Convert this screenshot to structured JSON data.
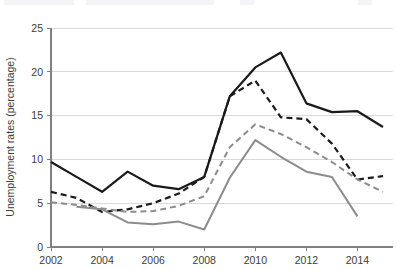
{
  "chart_data": {
    "type": "line",
    "title": "",
    "xlabel": "",
    "ylabel": "Unemployment rates (percentage)",
    "xlim": [
      2002,
      2015
    ],
    "ylim": [
      0,
      25
    ],
    "ytick_values": [
      0,
      5,
      10,
      15,
      20,
      25
    ],
    "ytick_labels": [
      "0",
      "5",
      "10",
      "15",
      "20",
      "25"
    ],
    "xtick_values": [
      2002,
      2004,
      2006,
      2008,
      2010,
      2012,
      2014
    ],
    "xtick_labels": [
      "2002",
      "2004",
      "2006",
      "2008",
      "2010",
      "2012",
      "2014"
    ],
    "grid": true,
    "legend": "none",
    "x": [
      2002,
      2003,
      2004,
      2005,
      2006,
      2007,
      2008,
      2009,
      2010,
      2011,
      2012,
      2013,
      2014,
      2015
    ],
    "series": [
      {
        "name": "series-black-solid",
        "style": "solid",
        "color": "#1a1a1a",
        "width": 2.2,
        "x": [
          2002,
          2003,
          2004,
          2005,
          2006,
          2007,
          2008,
          2009,
          2010,
          2011,
          2012,
          2013,
          2014,
          2015
        ],
        "values": [
          9.7,
          8.0,
          6.3,
          8.6,
          7.0,
          6.6,
          8.0,
          17.2,
          20.5,
          22.2,
          16.4,
          15.4,
          15.5,
          13.7
        ]
      },
      {
        "name": "series-black-dashed",
        "style": "dashed",
        "color": "#1a1a1a",
        "width": 2.2,
        "x": [
          2002,
          2003,
          2004,
          2005,
          2006,
          2007,
          2008,
          2009,
          2010,
          2011,
          2012,
          2013,
          2014,
          2015
        ],
        "values": [
          6.3,
          5.6,
          4.0,
          4.3,
          5.0,
          6.1,
          8.0,
          17.2,
          19.0,
          14.8,
          14.6,
          11.8,
          7.7,
          8.1
        ]
      },
      {
        "name": "series-gray-dashed",
        "style": "dashed",
        "color": "#8c8c8c",
        "width": 2.0,
        "x": [
          2002,
          2003,
          2004,
          2005,
          2006,
          2007,
          2008,
          2009,
          2010,
          2011,
          2012,
          2013,
          2014,
          2015
        ],
        "values": [
          5.1,
          4.8,
          4.4,
          4.0,
          4.1,
          4.7,
          5.8,
          11.4,
          14.0,
          12.9,
          11.4,
          9.7,
          7.7,
          6.3
        ]
      },
      {
        "name": "series-gray-solid",
        "style": "solid",
        "color": "#8c8c8c",
        "width": 2.0,
        "x": [
          2003,
          2004,
          2005,
          2006,
          2007,
          2008,
          2009,
          2010,
          2011,
          2012,
          2013,
          2014
        ],
        "values": [
          4.6,
          4.3,
          2.8,
          2.6,
          2.9,
          2.0,
          7.9,
          12.2,
          10.3,
          8.6,
          8.0,
          3.5
        ]
      }
    ]
  }
}
